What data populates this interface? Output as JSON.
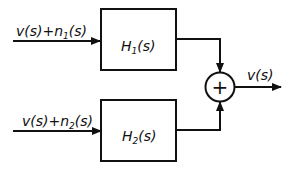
{
  "diagram": {
    "type": "block-diagram",
    "inputs": [
      {
        "id": "in1",
        "label": "v(s)+n1(s)",
        "parts": {
          "signal": "v(s)+n",
          "sub": "1",
          "tail": "(s)"
        }
      },
      {
        "id": "in2",
        "label": "v(s)+n2(s)",
        "parts": {
          "signal": "v(s)+n",
          "sub": "2",
          "tail": "(s)"
        }
      }
    ],
    "blocks": [
      {
        "id": "H1",
        "label": "H1(s)",
        "parts": {
          "name": "H",
          "sub": "1",
          "tail": "(s)"
        }
      },
      {
        "id": "H2",
        "label": "H2(s)",
        "parts": {
          "name": "H",
          "sub": "2",
          "tail": "(s)"
        }
      }
    ],
    "summer": {
      "id": "sum",
      "symbol": "+"
    },
    "output": {
      "id": "out",
      "label": "v(s)"
    },
    "edges": [
      {
        "from": "in1",
        "to": "H1"
      },
      {
        "from": "in2",
        "to": "H2"
      },
      {
        "from": "H1",
        "to": "sum"
      },
      {
        "from": "H2",
        "to": "sum"
      },
      {
        "from": "sum",
        "to": "out"
      }
    ],
    "colors": {
      "stroke": "#111111",
      "background": "#ffffff"
    }
  }
}
